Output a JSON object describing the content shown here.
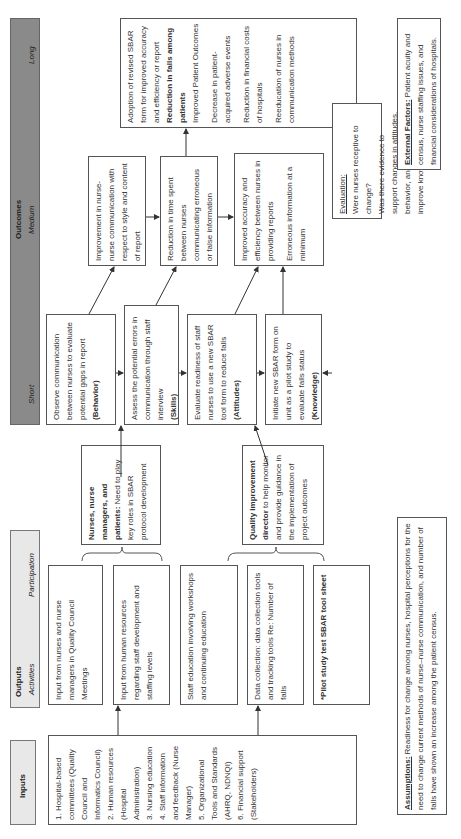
{
  "headers": {
    "inputs": "Inputs",
    "outputs": "Outputs",
    "activities": "Activities",
    "participation": "Participation",
    "outcomes": "Outcomes",
    "short": "Short",
    "medium": "Medium",
    "long": "Long"
  },
  "inputs": [
    "1. Hospital-based committees (Quality Council and Informatics Council)",
    "2. Human resources (Hospital Administration)",
    "3. Nursing education",
    "4. Staff information and feedback (Nurse Manager)",
    "5. Organizational Tools and Standards (AHRQ, NDNQI)",
    "6. Financial support (Stakeholders)"
  ],
  "activities": [
    "Input from nurses and nurse managers in Quality Council Meetings",
    "Input from human resources regarding staff development and staffing levels",
    "Staff education involving workshops and continuing education",
    "Data collection: data collection tools and tracking tools Re: Number of falls",
    "*Pilot study test SBAR tool sheet"
  ],
  "participation": [
    {
      "bold": "Nurses, nurse managers, and patients:",
      "text": " Need to play key roles in SBAR protocol development"
    },
    {
      "bold": "Quality improvement director",
      "text": " to help monitor and provide guidance in the implementation of project outcomes"
    }
  ],
  "short": [
    {
      "text": "Observe communication between nurses to evaluate potential gaps in report",
      "tag": "(Behavior)"
    },
    {
      "text": "Assess the potential errors in communication through staff interview",
      "tag": "(Skills)"
    },
    {
      "text": "Evaluate readiness of staff nurses to use a new SBAR tool form to reduce falls",
      "tag": "(Attitudes)"
    },
    {
      "text": "Initiate new SBAR form on unit as a pilot study to evaluate falls status",
      "tag": "(Knowledge)"
    }
  ],
  "medium": [
    {
      "lines": [
        "Improvement in nurse-nurse communication with respect to style and content of report"
      ]
    },
    {
      "lines": [
        "Reduction in time spent between nurses communicating erroneous or false information"
      ]
    },
    {
      "lines": [
        "Improved accuracy and efficiency between nurses in providing reports",
        "Erroneous information at a minimum"
      ]
    }
  ],
  "long": [
    {
      "text": "Adoption of revised SBAR form for improved accuracy and efficiency or report",
      "bold": false
    },
    {
      "text": "Reduction in falls among patients",
      "bold": true
    },
    {
      "text": "Improved Patient Outcomes",
      "bold": false
    },
    {
      "text": "Decrease in patient-acquired adverse events",
      "bold": false
    },
    {
      "text": "Reduction in financial costs of hospitals",
      "bold": false
    },
    {
      "text": "Reeducation of nurses in communication methods",
      "bold": false
    }
  ],
  "evaluation": {
    "label": "Evaluation:",
    "lines": [
      "Were nurses receptive to change?",
      "Was there evidence to support changes in attitudes, behavior, and skills to improve knowledge?"
    ]
  },
  "external_factors": {
    "label": "External Factors:",
    "text": " Patient acuity and census, nurse staffing issues, and financial considerations of hospitals."
  },
  "assumptions": {
    "label": "Assumptions:",
    "text": " Readiness for change among nurses, hospital perceptions for the need to change current methods of nurse–nurse communication, and number of falls have shown an increase among the patient census."
  }
}
